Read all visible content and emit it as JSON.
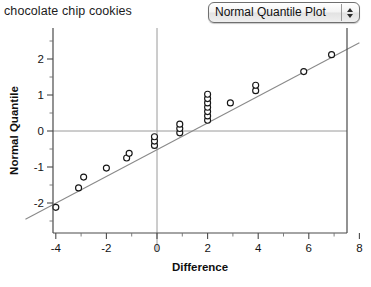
{
  "header": {
    "title": "chocolate chip cookies",
    "dropdown": {
      "selected": "Normal Quantile Plot",
      "up_arrow_icon": "caret-up-icon",
      "down_arrow_icon": "caret-down-icon"
    }
  },
  "chart_data": {
    "type": "scatter",
    "title": "chocolate chip cookies",
    "xlabel": "Difference",
    "ylabel": "Normal Quantile",
    "xlim": [
      -5.2,
      8.6
    ],
    "ylim": [
      -2.55,
      2.6
    ],
    "xticks": [
      -4,
      -2,
      0,
      2,
      4,
      6,
      8
    ],
    "xtick_labels": [
      "-4",
      "-2",
      "0",
      "2",
      "4",
      "6",
      "8"
    ],
    "xminor": [
      -5,
      -3,
      -1,
      1,
      3,
      5,
      7
    ],
    "yticks": [
      -2,
      -1,
      0,
      1,
      2
    ],
    "ytick_labels": [
      "-2",
      "-1",
      "0",
      "1",
      "2"
    ],
    "yminor": [
      -2.5,
      -1.5,
      -0.5,
      0.5,
      1.5,
      2.5
    ],
    "grid": false,
    "zero_lines": {
      "x": 0,
      "y": 0
    },
    "legend": null,
    "reference_line": {
      "name": "normal-reference-line",
      "x": [
        -5.2,
        8.0
      ],
      "y": [
        -2.45,
        2.45
      ]
    },
    "series": [
      {
        "name": "Difference",
        "marker": "open-circle",
        "points": [
          [
            -4.0,
            -2.12
          ],
          [
            -3.1,
            -1.58
          ],
          [
            -2.9,
            -1.28
          ],
          [
            -2.0,
            -1.03
          ],
          [
            -1.2,
            -0.75
          ],
          [
            -1.1,
            -0.62
          ],
          [
            -0.1,
            -0.4
          ],
          [
            -0.1,
            -0.28
          ],
          [
            -0.1,
            -0.16
          ],
          [
            0.9,
            -0.05
          ],
          [
            0.9,
            0.07
          ],
          [
            0.9,
            0.19
          ],
          [
            2.0,
            0.3
          ],
          [
            2.0,
            0.42
          ],
          [
            2.0,
            0.54
          ],
          [
            2.0,
            0.66
          ],
          [
            2.0,
            0.78
          ],
          [
            2.0,
            0.9
          ],
          [
            2.0,
            1.02
          ],
          [
            2.9,
            0.78
          ],
          [
            3.9,
            1.12
          ],
          [
            3.9,
            1.27
          ],
          [
            5.8,
            1.65
          ],
          [
            6.9,
            2.12
          ]
        ]
      }
    ]
  }
}
